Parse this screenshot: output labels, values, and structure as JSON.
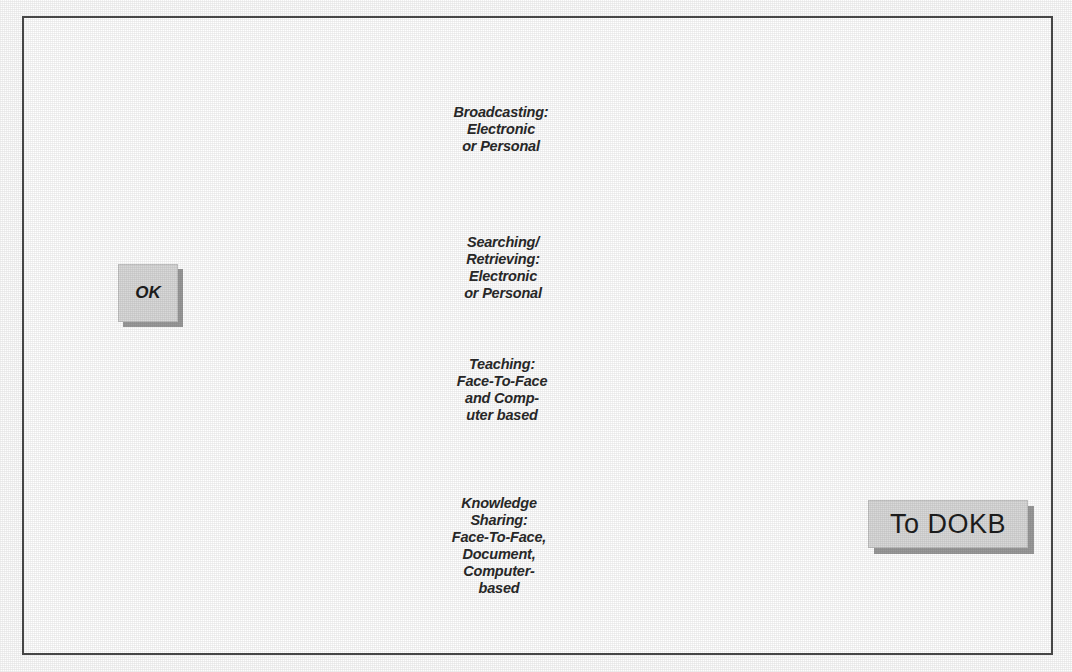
{
  "figure": {
    "background_color": "#9c9c9c",
    "shape_fill_color": "#dcdcdc",
    "line_color": "#1a1a1a",
    "frame_color": "#4a4a4a"
  },
  "nodes": {
    "start": {
      "label": "OK",
      "name": "ok-node"
    },
    "end": {
      "label": "To DOKB",
      "name": "to-dokb-node"
    }
  },
  "processes": [
    {
      "id": "broadcasting",
      "label": "Broadcasting:\nElectronic\nor Personal"
    },
    {
      "id": "searching-retrieving",
      "label": "Searching/\nRetrieving:\nElectronic\nor Personal"
    },
    {
      "id": "teaching",
      "label": "Teaching:\nFace-To-Face\nand Comp-\nuter based"
    },
    {
      "id": "knowledge-sharing",
      "label": "Knowledge\nSharing:\nFace-To-Face,\nDocument,\nComputer-\nbased"
    }
  ]
}
